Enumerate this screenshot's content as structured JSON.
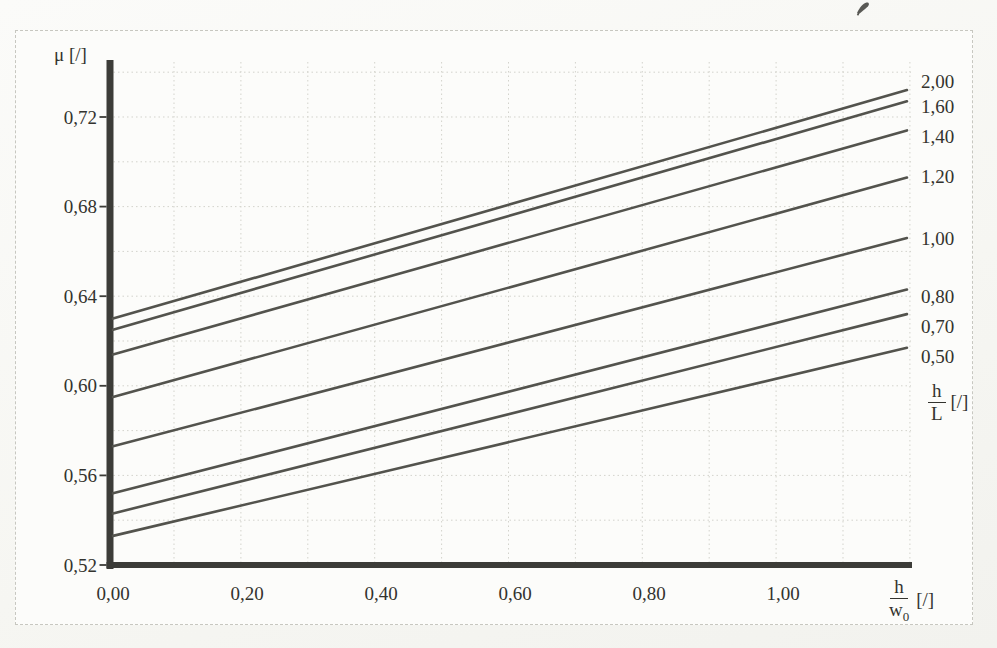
{
  "colors": {
    "axis": "#3c3c38",
    "line": "#53534d",
    "grid": "#d3d3cc",
    "text": "#33332e",
    "border": "#c7c7c0",
    "paper": "#fcfcfa"
  },
  "labels": {
    "y_axis": "μ [/]",
    "x_frac": {
      "num": "h",
      "den": "w",
      "den_sub": "0",
      "unit": "[/]"
    },
    "param_frac": {
      "num": "h",
      "den": "L",
      "unit": "[/]"
    }
  },
  "marks": {
    "ink_mark": "small-handwritten-ink-scribble-top-right"
  },
  "chart_data": {
    "type": "line",
    "title": "",
    "ylabel": "μ [/]",
    "xlabel": "h/w0 [/]",
    "param_label": "h/L [/]",
    "decimal_separator": ",",
    "xlim": [
      0,
      1.185
    ],
    "ylim": [
      0.52,
      0.745
    ],
    "grid": {
      "show": true,
      "x_step": 0.1,
      "y_step": 0.02
    },
    "legend_position": "right-of-line-ends",
    "x_ticks": {
      "values": [
        0,
        0.2,
        0.4,
        0.6,
        0.8,
        1.0
      ],
      "labels": [
        "0,00",
        "0,20",
        "0,40",
        "0,60",
        "0,80",
        "1,00"
      ]
    },
    "y_ticks": {
      "values": [
        0.72,
        0.68,
        0.64,
        0.6,
        0.56,
        0.52
      ],
      "labels": [
        "0,72",
        "0,68",
        "0,64",
        "0,60",
        "0,56",
        "0,52"
      ]
    },
    "series": [
      {
        "label": "2,00",
        "h_over_L": 2.0,
        "x": [
          0,
          1.185
        ],
        "y": [
          0.63,
          0.732
        ]
      },
      {
        "label": "1,60",
        "h_over_L": 1.6,
        "x": [
          0,
          1.185
        ],
        "y": [
          0.625,
          0.727
        ]
      },
      {
        "label": "1,40",
        "h_over_L": 1.4,
        "x": [
          0,
          1.185
        ],
        "y": [
          0.614,
          0.714
        ]
      },
      {
        "label": "1,20",
        "h_over_L": 1.2,
        "x": [
          0,
          1.185
        ],
        "y": [
          0.595,
          0.693
        ]
      },
      {
        "label": "1,00",
        "h_over_L": 1.0,
        "x": [
          0,
          1.185
        ],
        "y": [
          0.573,
          0.666
        ]
      },
      {
        "label": "0,80",
        "h_over_L": 0.8,
        "x": [
          0,
          1.185
        ],
        "y": [
          0.552,
          0.643
        ]
      },
      {
        "label": "0,70",
        "h_over_L": 0.7,
        "x": [
          0,
          1.185
        ],
        "y": [
          0.543,
          0.632
        ]
      },
      {
        "label": "0,50",
        "h_over_L": 0.5,
        "x": [
          0,
          1.185
        ],
        "y": [
          0.533,
          0.617
        ]
      }
    ]
  }
}
